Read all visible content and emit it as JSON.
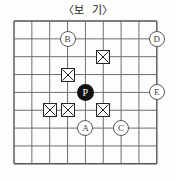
{
  "title": "〈보  기〉",
  "board": {
    "size": 9,
    "origin_x": 14,
    "origin_y": 21,
    "spacing": 17.85,
    "line_color": "#6e6e6e",
    "border_color": "#555555",
    "background": "#fdfdfd"
  },
  "stones": [
    {
      "label": "P",
      "col": 5,
      "row": 5,
      "color": "#111111",
      "text_color": "#ffffff",
      "name": "black-stone-p"
    }
  ],
  "marks": [
    {
      "symbol": "X",
      "col": 6,
      "row": 3,
      "name": "x-mark-1"
    },
    {
      "symbol": "X",
      "col": 4,
      "row": 4,
      "name": "x-mark-2"
    },
    {
      "symbol": "X",
      "col": 3,
      "row": 6,
      "name": "x-mark-3"
    },
    {
      "symbol": "X",
      "col": 4,
      "row": 6,
      "name": "x-mark-4"
    },
    {
      "symbol": "X",
      "col": 6,
      "row": 6,
      "name": "x-mark-5"
    }
  ],
  "labels": [
    {
      "label": "B",
      "col": 4,
      "row": 2,
      "name": "label-circle-b"
    },
    {
      "label": "D",
      "col": 9,
      "row": 2,
      "name": "label-circle-d"
    },
    {
      "label": "E",
      "col": 9,
      "row": 5,
      "name": "label-circle-e"
    },
    {
      "label": "A",
      "col": 5,
      "row": 7,
      "name": "label-circle-a"
    },
    {
      "label": "C",
      "col": 7,
      "row": 7,
      "name": "label-circle-c"
    }
  ]
}
